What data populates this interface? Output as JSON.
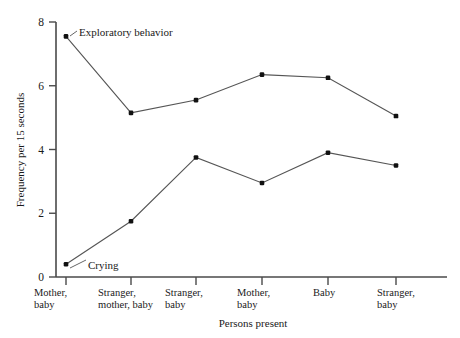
{
  "chart_data": {
    "type": "line",
    "title": "",
    "xlabel": "Persons present",
    "ylabel": "Frequency per 15 seconds",
    "categories": [
      "Mother, baby",
      "Stranger, mother, baby",
      "Stranger, baby",
      "Mother, baby",
      "Baby",
      "Stranger, baby"
    ],
    "category_lines": [
      [
        "Mother,",
        "baby"
      ],
      [
        "Stranger,",
        "mother, baby"
      ],
      [
        "Stranger,",
        "baby"
      ],
      [
        "Mother,",
        "baby"
      ],
      [
        "Baby",
        ""
      ],
      [
        "Stranger,",
        "baby"
      ]
    ],
    "ylim": [
      0,
      8
    ],
    "yticks": [
      0,
      2,
      4,
      6,
      8
    ],
    "ytick_labels": [
      "0",
      "2",
      "4",
      "6",
      "8"
    ],
    "grid": false,
    "legend_position": "inline-annotation",
    "series": [
      {
        "name": "Exploratory behavior",
        "values": [
          7.55,
          5.15,
          5.55,
          6.35,
          6.25,
          5.05
        ]
      },
      {
        "name": "Crying",
        "values": [
          0.4,
          1.75,
          3.75,
          2.95,
          3.9,
          3.5
        ]
      }
    ],
    "annotations": [
      {
        "text": "Exploratory behavior",
        "series": "Exploratory behavior"
      },
      {
        "text": "Crying",
        "series": "Crying"
      }
    ],
    "colors": {
      "line": "#555555",
      "marker": "#111111",
      "axis": "#4a4a4a",
      "text": "#1a1a1a",
      "background": "#ffffff"
    }
  }
}
